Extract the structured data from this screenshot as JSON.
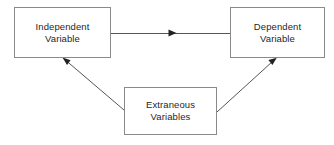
{
  "diagram": {
    "canvas": {
      "width": 334,
      "height": 145,
      "background": "#ffffff"
    },
    "style": {
      "box_border_color": "#8a8a8a",
      "box_fill_color": "#ffffff",
      "edge_color": "#555555",
      "text_color": "#1f1f1f"
    },
    "nodes": [
      {
        "id": "independent",
        "label": "Independent\nVariable",
        "line1": "Independent",
        "line2": "Variable",
        "shape": "rectangle",
        "x": 14,
        "y": 7,
        "width": 97,
        "height": 51
      },
      {
        "id": "dependent",
        "label": "Dependent\nVariable",
        "line1": "Dependent",
        "line2": "Variable",
        "shape": "rectangle",
        "x": 230,
        "y": 7,
        "width": 95,
        "height": 51
      },
      {
        "id": "extraneous",
        "label": "Extraneous\nVariables",
        "line1": "Extraneous",
        "line2": "Variables",
        "shape": "rectangle",
        "x": 124,
        "y": 87,
        "width": 93,
        "height": 48
      }
    ],
    "edges": [
      {
        "id": "independent-to-dependent",
        "from": "independent",
        "to": "dependent",
        "label": "",
        "arrowhead": "mid",
        "direction": "horizontal"
      },
      {
        "id": "extraneous-to-independent",
        "from": "extraneous",
        "to": "independent",
        "label": "",
        "arrowhead": "end",
        "direction": "diagonal-up-left"
      },
      {
        "id": "extraneous-to-dependent",
        "from": "extraneous",
        "to": "dependent",
        "label": "",
        "arrowhead": "end",
        "direction": "diagonal-up-right"
      }
    ]
  }
}
